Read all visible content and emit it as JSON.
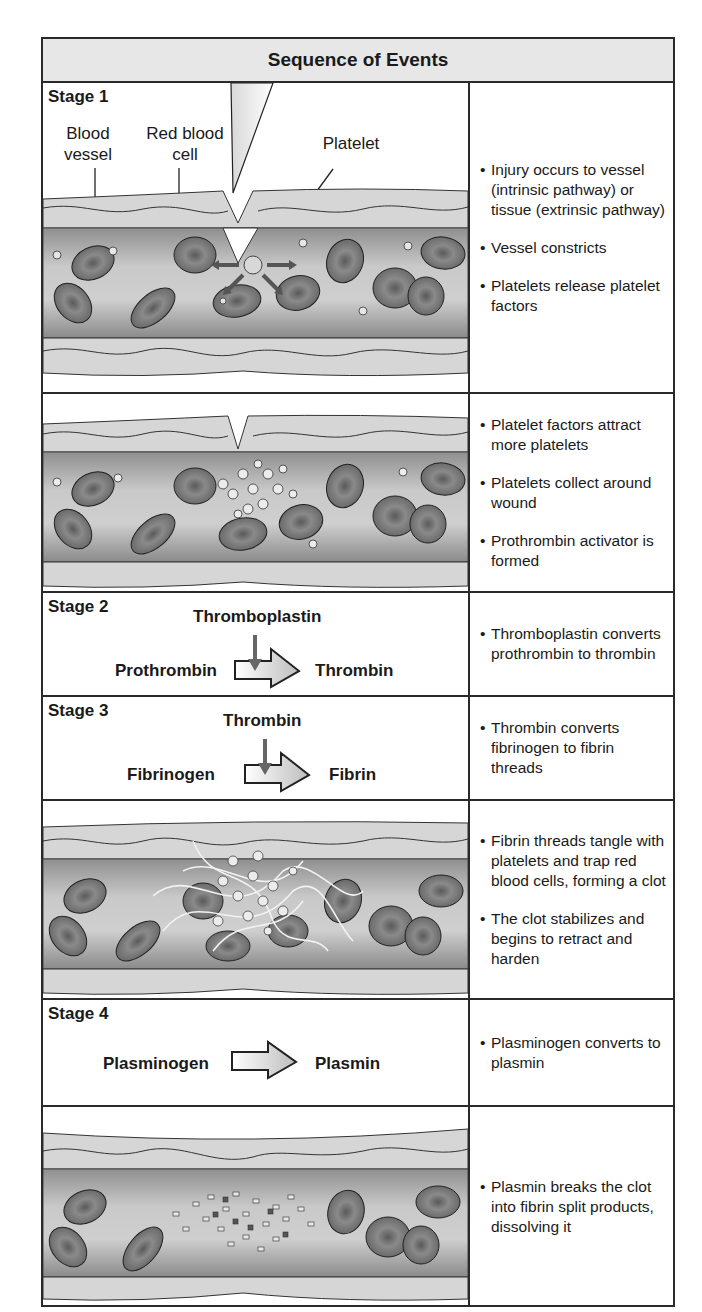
{
  "title": "Sequence of Events",
  "stages": [
    {
      "label": "Stage 1",
      "illustration_labels": [
        "Blood vessel",
        "Red blood cell",
        "Platelet"
      ],
      "bullets": [
        "Injury occurs to vessel (intrinsic pathway) or tissue (extrinsic pathway)",
        "Vessel constricts",
        "Platelets release platelet factors"
      ]
    },
    {
      "label": "",
      "bullets": [
        "Platelet factors attract more platelets",
        "Platelets collect around wound",
        "Prothrombin activator is formed"
      ]
    },
    {
      "label": "Stage 2",
      "reaction": {
        "catalyst": "Thromboplastin",
        "from": "Prothrombin",
        "to": "Thrombin"
      },
      "bullets": [
        "Thromboplastin converts prothrombin to thrombin"
      ]
    },
    {
      "label": "Stage 3",
      "reaction": {
        "catalyst": "Thrombin",
        "from": "Fibrinogen",
        "to": "Fibrin"
      },
      "bullets": [
        "Thrombin converts fibrinogen to fibrin threads"
      ]
    },
    {
      "label": "",
      "bullets": [
        "Fibrin threads tangle with platelets and trap red blood cells, forming a clot",
        "The clot stabilizes and begins to retract and harden"
      ]
    },
    {
      "label": "Stage 4",
      "reaction": {
        "catalyst": "",
        "from": "Plasminogen",
        "to": "Plasmin"
      },
      "bullets": [
        "Plasminogen converts to plasmin"
      ]
    },
    {
      "label": "",
      "bullets": [
        "Plasmin breaks the clot into fibrin split products, dissolving it"
      ]
    }
  ],
  "colors": {
    "header_bg": "#e7e7e7",
    "border": "#2a2a2a",
    "rbc": "#6e6e6e",
    "vessel": "#b8b8b8",
    "arrow": "#555555"
  }
}
